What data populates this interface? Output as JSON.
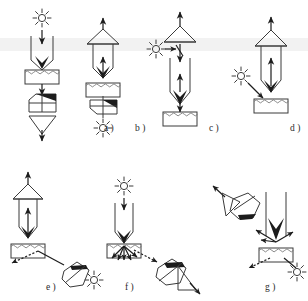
{
  "figure": {
    "type": "optical-measurement-geometry-diagram",
    "panel_count": 7,
    "background_color": "#ffffff",
    "line_color": "#3a3a3a",
    "accent_color": "#1c1c1c",
    "band_color": "#ededed",
    "canvas": {
      "width": 308,
      "height": 301
    }
  },
  "symbols": {
    "sun": "light-source-sun-icon",
    "triangle": "lens-cone-icon",
    "hatched_box": "sample-rough-surface-icon",
    "prism": "prism-dispersing-element-icon",
    "funnel": "detector-funnel-icon",
    "arrow": "beam-direction-arrow-icon",
    "beam_pair": "collimated-beam-pair-icon"
  },
  "panels": [
    {
      "id": "a",
      "label": "a )",
      "label_x": 104,
      "label_y": 131,
      "source": "sun",
      "source_position": "top",
      "detector_position": "bottom",
      "elements": [
        "sun",
        "beam_pair",
        "hatched_box",
        "prism",
        "funnel"
      ],
      "beam_direction": "downward"
    },
    {
      "id": "b",
      "label": "b )",
      "label_x": 135,
      "label_y": 131,
      "source": "sun",
      "source_position": "bottom",
      "detector_position": "top",
      "elements": [
        "triangle",
        "beam_pair",
        "hatched_box",
        "prism",
        "sun"
      ],
      "beam_direction": "upward"
    },
    {
      "id": "c",
      "label": "c )",
      "label_x": 209,
      "label_y": 131,
      "source": "sun",
      "source_position": "left",
      "detector_position": "top",
      "elements": [
        "triangle",
        "sun",
        "beam_pair",
        "hatched_box"
      ],
      "beam_direction": "bidirectional"
    },
    {
      "id": "d",
      "label": "d )",
      "label_x": 290,
      "label_y": 131,
      "source": "sun",
      "source_position": "left-oblique",
      "detector_position": "top",
      "elements": [
        "triangle",
        "beam_pair",
        "sun",
        "hatched_box"
      ],
      "beam_direction": "upward"
    },
    {
      "id": "e",
      "label": "e )",
      "label_x": 46,
      "label_y": 290,
      "source": "sun",
      "source_position": "bottom-right",
      "detector_position": "top",
      "elements": [
        "triangle",
        "beam_pair",
        "hatched_box",
        "prism",
        "sun"
      ],
      "beam_direction": "upward"
    },
    {
      "id": "f",
      "label": "f )",
      "label_x": 125,
      "label_y": 290,
      "source": "sun",
      "source_position": "top",
      "detector_position": "bottom-right",
      "elements": [
        "sun",
        "beam_pair",
        "hatched_box",
        "prism",
        "funnel"
      ],
      "beam_direction": "downward-then-oblique"
    },
    {
      "id": "g",
      "label": "g )",
      "label_x": 265,
      "label_y": 290,
      "source": "sun",
      "source_position": "bottom-right",
      "detector_position": "upper-left",
      "elements": [
        "prism",
        "funnel",
        "beam_pair",
        "hatched_box",
        "sun"
      ],
      "beam_direction": "oblique-scatter"
    }
  ]
}
